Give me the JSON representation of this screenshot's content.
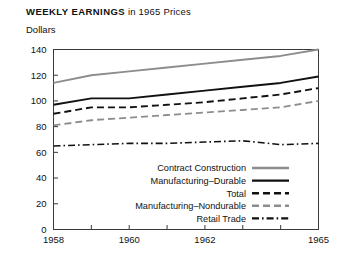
{
  "title": {
    "strong": "WEEKLY EARNINGS",
    "light": " in 1965 Prices"
  },
  "axis_unit": "Dollars",
  "colors": {
    "black": "#111111",
    "gray": "#8d8d8d",
    "frame": "#3a3a3a",
    "background": "#ffffff"
  },
  "chart_data": {
    "type": "line",
    "title": "WEEKLY EARNINGS in 1965 Prices",
    "subtitle": "Dollars",
    "xlabel": "",
    "ylabel": "Dollars",
    "xlim": [
      1958,
      1965
    ],
    "ylim": [
      0,
      140
    ],
    "yticks": [
      0,
      20,
      40,
      60,
      80,
      100,
      120,
      140
    ],
    "ytick_labels": [
      "0",
      "20",
      "40",
      "60",
      "80",
      "100",
      "120",
      "140"
    ],
    "xticks": [
      1958,
      1959,
      1960,
      1961,
      1962,
      1963,
      1964,
      1965
    ],
    "xtick_labels_shown": [
      "1958",
      "1960",
      "1962",
      "1965"
    ],
    "xtick_labels_shown_at": [
      1958,
      1960,
      1962,
      1965
    ],
    "grid": false,
    "legend_position": "inside-lower-right",
    "x": [
      1958,
      1959,
      1960,
      1961,
      1962,
      1963,
      1964,
      1965
    ],
    "series": [
      {
        "name": "Contract Construction",
        "values": [
          114,
          120,
          123,
          126,
          129,
          132,
          135,
          140
        ],
        "color": "#8d8d8d",
        "style": "solid",
        "width": 1.9
      },
      {
        "name": "Manufacturing–Durable",
        "values": [
          97,
          102,
          102,
          105,
          108,
          111,
          114,
          119
        ],
        "color": "#111111",
        "style": "solid",
        "width": 1.9
      },
      {
        "name": "Total",
        "values": [
          90,
          95,
          95,
          97,
          99,
          102,
          105,
          110
        ],
        "color": "#111111",
        "style": "dashed",
        "width": 1.9
      },
      {
        "name": "Manufacturing–Nondurable",
        "values": [
          81,
          85,
          87,
          89,
          91,
          93,
          95,
          100
        ],
        "color": "#8d8d8d",
        "style": "dashed",
        "width": 1.9
      },
      {
        "name": "Retail Trade",
        "values": [
          65,
          66,
          67,
          67,
          68,
          69,
          66,
          67
        ],
        "color": "#111111",
        "style": "dashdot",
        "width": 1.6
      }
    ]
  },
  "legend": {
    "items": [
      {
        "label": "Contract Construction",
        "series": 0
      },
      {
        "label": "Manufacturing–Durable",
        "series": 1
      },
      {
        "label": "Total",
        "series": 2
      },
      {
        "label": "Manufacturing–Nondurable",
        "series": 3
      },
      {
        "label": "Retail Trade",
        "series": 4
      }
    ]
  }
}
